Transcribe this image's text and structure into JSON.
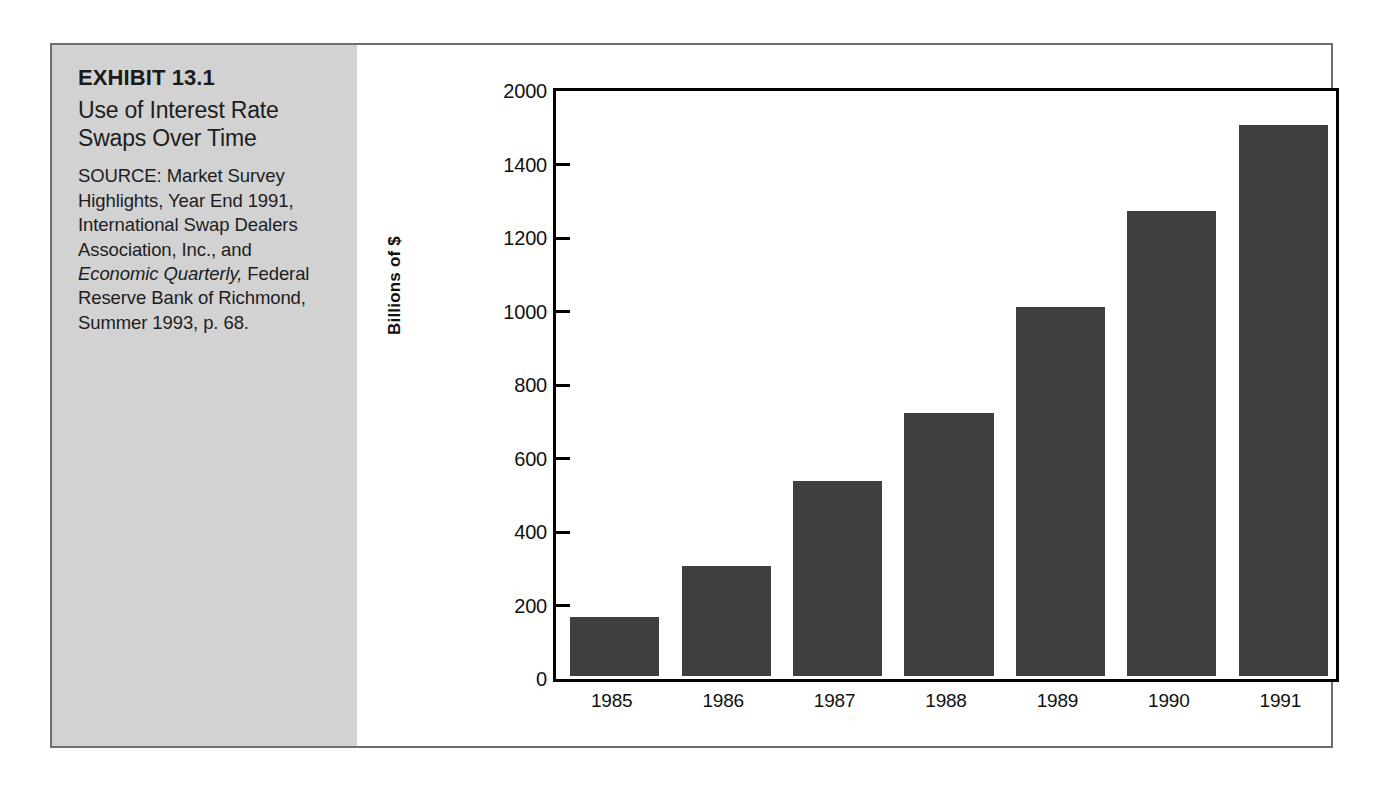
{
  "exhibit": {
    "number": "EXHIBIT 13.1",
    "title": "Use of Interest Rate Swaps Over Time",
    "source_part1": "SOURCE: Market Survey Highlights, Year End 1991, International Swap Dealers Association, Inc., and ",
    "source_italic": "Economic Quarterly,",
    "source_part2": " Federal Reserve Bank of Richmond, Summer 1993, p. 68."
  },
  "colors": {
    "bar_fill": "#3f3f3f",
    "panel_background": "#d2d2d2",
    "frame_border": "#6e6e6e",
    "axis": "#000000"
  },
  "chart_data": {
    "type": "bar",
    "title": "Use of Interest Rate Swaps Over Time",
    "xlabel": "",
    "ylabel": "Billions of $",
    "categories": [
      "1985",
      "1986",
      "1987",
      "1988",
      "1989",
      "1990",
      "1991"
    ],
    "values": [
      160,
      300,
      530,
      715,
      1005,
      1265,
      1500
    ],
    "ytick_labels": [
      "0",
      "200",
      "400",
      "600",
      "800",
      "1000",
      "1200",
      "1400",
      "2000"
    ],
    "ytick_positions": [
      0,
      200,
      400,
      600,
      800,
      1000,
      1200,
      1400,
      1600
    ],
    "ylim": [
      0,
      1600
    ],
    "grid": false,
    "legend": "none"
  }
}
